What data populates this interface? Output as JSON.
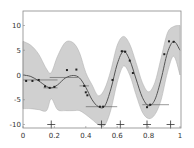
{
  "chart_data": {
    "type": "line",
    "title": "",
    "xlabel": "",
    "ylabel": "",
    "xlim": [
      0,
      1
    ],
    "ylim": [
      -11,
      13
    ],
    "grid": false,
    "legend": null,
    "x_ticks": [
      "0",
      "0.2",
      "0.4",
      "0.6",
      "0.8",
      "1"
    ],
    "y_ticks": [
      "-10",
      "-5",
      "0",
      "5",
      "10"
    ],
    "series": [
      {
        "name": "mean",
        "style": "line",
        "color": "#555555",
        "x": [
          0,
          0.05,
          0.1,
          0.15,
          0.18,
          0.22,
          0.27,
          0.32,
          0.36,
          0.4,
          0.44,
          0.48,
          0.52,
          0.56,
          0.6,
          0.64,
          0.68,
          0.72,
          0.76,
          0.8,
          0.84,
          0.88,
          0.92,
          0.96,
          1.0
        ],
        "values": [
          0,
          -0.3,
          -1.2,
          -2.3,
          -2.6,
          -2.0,
          -0.6,
          -0.1,
          -0.6,
          -2.5,
          -5.0,
          -6.4,
          -6.3,
          -2.8,
          2.2,
          4.8,
          3.0,
          -0.8,
          -4.5,
          -6.2,
          -5.0,
          -0.8,
          4.5,
          6.8,
          5.0
        ]
      },
      {
        "name": "confidence-band-upper",
        "style": "area",
        "color": "#d0d0d0",
        "x": [
          0,
          0.05,
          0.1,
          0.15,
          0.18,
          0.22,
          0.27,
          0.32,
          0.36,
          0.4,
          0.44,
          0.48,
          0.52,
          0.56,
          0.6,
          0.64,
          0.68,
          0.72,
          0.76,
          0.8,
          0.84,
          0.88,
          0.92,
          0.96,
          1.0
        ],
        "values": [
          6.8,
          6.0,
          4.2,
          1.2,
          0.5,
          3.8,
          6.6,
          6.5,
          4.5,
          0.5,
          -2.0,
          -4.2,
          -2.8,
          1.0,
          6.0,
          7.8,
          6.2,
          2.5,
          -1.5,
          -3.4,
          -1.5,
          3.5,
          8.5,
          9.8,
          10.0
        ]
      },
      {
        "name": "confidence-band-lower",
        "style": "area",
        "color": "#d0d0d0",
        "x": [
          0,
          0.05,
          0.1,
          0.15,
          0.18,
          0.22,
          0.27,
          0.32,
          0.36,
          0.4,
          0.44,
          0.48,
          0.52,
          0.56,
          0.6,
          0.64,
          0.68,
          0.72,
          0.76,
          0.8,
          0.84,
          0.88,
          0.92,
          0.96,
          1.0
        ],
        "values": [
          -6.8,
          -6.8,
          -7.0,
          -7.2,
          -4.8,
          -7.0,
          -7.2,
          -7.2,
          -7.2,
          -8.0,
          -9.0,
          -10.0,
          -10.2,
          -7.0,
          -1.5,
          1.8,
          0.0,
          -4.0,
          -7.5,
          -8.8,
          -8.0,
          -5.0,
          0.5,
          3.8,
          0.0
        ]
      },
      {
        "name": "observations",
        "style": "scatter",
        "color": "#222222",
        "x": [
          0.02,
          0.06,
          0.1,
          0.14,
          0.17,
          0.2,
          0.28,
          0.34,
          0.39,
          0.4,
          0.41,
          0.49,
          0.51,
          0.57,
          0.63,
          0.65,
          0.68,
          0.7,
          0.79,
          0.81,
          0.9,
          0.93,
          0.96
        ],
        "values": [
          -1.2,
          -1.2,
          -1.0,
          -2.3,
          -2.6,
          -2.4,
          1.0,
          1.1,
          -2.2,
          -3.5,
          -4.1,
          -6.4,
          -6.4,
          -1.0,
          4.8,
          4.7,
          2.9,
          0.4,
          -6.5,
          -6.0,
          4.2,
          6.8,
          6.7
        ]
      },
      {
        "name": "horizontal-error-bars",
        "style": "errorbar-x",
        "color": "#555555",
        "items": [
          {
            "x": 0.1,
            "y": -1.0,
            "xerr": [
              0.0,
              0.22
            ]
          },
          {
            "x": 0.18,
            "y": -2.6,
            "xerr": [
              0.13,
              0.22
            ]
          },
          {
            "x": 0.25,
            "y": -0.5,
            "xerr": [
              0.17,
              0.35
            ]
          },
          {
            "x": 0.4,
            "y": -2.2,
            "xerr": [
              0.36,
              0.42
            ]
          },
          {
            "x": 0.5,
            "y": -6.4,
            "xerr": [
              0.4,
              0.6
            ]
          },
          {
            "x": 0.64,
            "y": 4.8,
            "xerr": [
              0.62,
              0.66
            ]
          },
          {
            "x": 0.8,
            "y": -6.0,
            "xerr": [
              0.76,
              0.93
            ]
          }
        ]
      },
      {
        "name": "input-markers",
        "style": "plus-markers",
        "color": "#333333",
        "x": [
          0.18,
          0.5,
          0.62,
          0.79,
          0.94
        ],
        "values": [
          -10,
          -10,
          -10,
          -10,
          -10
        ]
      }
    ]
  },
  "axes": {
    "x_ticks": [
      {
        "value": 0,
        "label": "0"
      },
      {
        "value": 0.2,
        "label": "0.2"
      },
      {
        "value": 0.4,
        "label": "0.4"
      },
      {
        "value": 0.6,
        "label": "0.6"
      },
      {
        "value": 0.8,
        "label": "0.8"
      },
      {
        "value": 1,
        "label": "1"
      }
    ],
    "y_ticks": [
      {
        "value": 10,
        "label": "10"
      },
      {
        "value": 5,
        "label": "5"
      },
      {
        "value": 0,
        "label": "0"
      },
      {
        "value": -5,
        "label": "-5"
      },
      {
        "value": -10,
        "label": "-10"
      }
    ]
  }
}
